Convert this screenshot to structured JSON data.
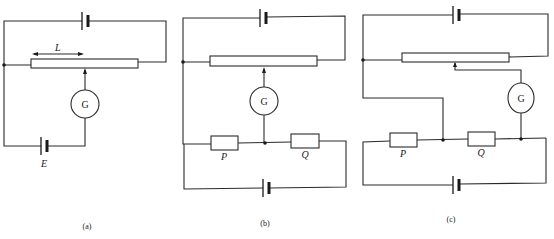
{
  "figure": {
    "panels": [
      {
        "id": "a",
        "caption": "(a)",
        "components": {
          "driver_cell": "cell",
          "slide_wire": "slide-wire",
          "length_label": "L",
          "galvanometer": "G",
          "test_cell_label": "E"
        }
      },
      {
        "id": "b",
        "caption": "(b)",
        "components": {
          "driver_cell": "cell",
          "slide_wire": "slide-wire",
          "galvanometer": "G",
          "resistor_1": "P",
          "resistor_2": "Q",
          "bridge_cell": "cell"
        }
      },
      {
        "id": "c",
        "caption": "(c)",
        "components": {
          "driver_cell": "cell",
          "slide_wire": "slide-wire",
          "galvanometer": "G",
          "resistor_1": "P",
          "resistor_2": "Q",
          "bridge_cell": "cell"
        }
      }
    ],
    "colors": {
      "line": "#2a2a2a",
      "background": "#ffffff"
    }
  }
}
